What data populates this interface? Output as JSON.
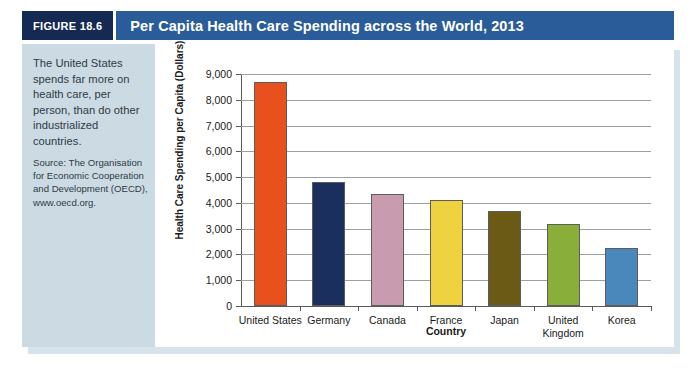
{
  "header": {
    "figure_tag": "FIGURE 18.6",
    "title": "Per Capita Health Care Spending across the World, 2013"
  },
  "sidebar": {
    "caption": "The United States spends far more on health care, per person, than do other industrialized countries.",
    "source": "Source: The Organisation for Economic Cooperation and Development (OECD), www.oecd.org."
  },
  "chart_data": {
    "type": "bar",
    "title": "Per Capita Health Care Spending across the World, 2013",
    "xlabel": "Country",
    "ylabel": "Health Care Spending per Capita (Dollars)",
    "categories": [
      "United States",
      "Germany",
      "Canada",
      "France",
      "Japan",
      "United Kingdom",
      "Korea"
    ],
    "values": [
      8700,
      4800,
      4350,
      4100,
      3700,
      3200,
      2250
    ],
    "colors": [
      "#e8511e",
      "#1b2f5e",
      "#c99bae",
      "#efd23f",
      "#6b5a15",
      "#8aae3a",
      "#4a87ba"
    ],
    "ylim": [
      0,
      9000
    ],
    "ytick_values": [
      0,
      1000,
      2000,
      3000,
      4000,
      5000,
      6000,
      7000,
      8000,
      9000
    ],
    "ytick_labels": [
      "0",
      "1,000",
      "2,000",
      "3,000",
      "4,000",
      "5,000",
      "6,000",
      "7,000",
      "8,000",
      "9,000"
    ],
    "grid": true,
    "legend": false
  }
}
